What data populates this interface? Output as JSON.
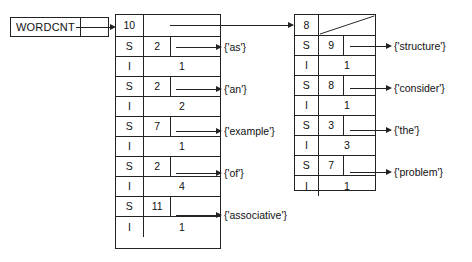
{
  "diagram": {
    "variable": {
      "name": "WORDCNT",
      "pointer_cell": ""
    },
    "left_table": {
      "header": {
        "count": "10",
        "pointer": ""
      },
      "entries": [
        {
          "type": "S",
          "length": "2",
          "value": "{'as'}"
        },
        {
          "type": "I",
          "count": "1"
        },
        {
          "type": "S",
          "length": "2",
          "value": "{'an'}"
        },
        {
          "type": "I",
          "count": "2"
        },
        {
          "type": "S",
          "length": "7",
          "value": "{'example'}"
        },
        {
          "type": "I",
          "count": "1"
        },
        {
          "type": "S",
          "length": "2",
          "value": "{'of'}"
        },
        {
          "type": "I",
          "count": "4"
        },
        {
          "type": "S",
          "length": "11",
          "value": "{'associative'}"
        },
        {
          "type": "I",
          "count": "1"
        }
      ]
    },
    "right_table": {
      "header": {
        "count": "8",
        "pointer": "null"
      },
      "entries": [
        {
          "type": "S",
          "length": "9",
          "value": "{'structure'}"
        },
        {
          "type": "I",
          "count": "1"
        },
        {
          "type": "S",
          "length": "8",
          "value": "{'consider'}"
        },
        {
          "type": "I",
          "count": "1"
        },
        {
          "type": "S",
          "length": "3",
          "value": "{'the'}"
        },
        {
          "type": "I",
          "count": "3"
        },
        {
          "type": "S",
          "length": "7",
          "value": "{'problem'}"
        },
        {
          "type": "I",
          "count": "1"
        }
      ]
    },
    "colors": {
      "ink": "#222222",
      "background": "#ffffff"
    }
  }
}
